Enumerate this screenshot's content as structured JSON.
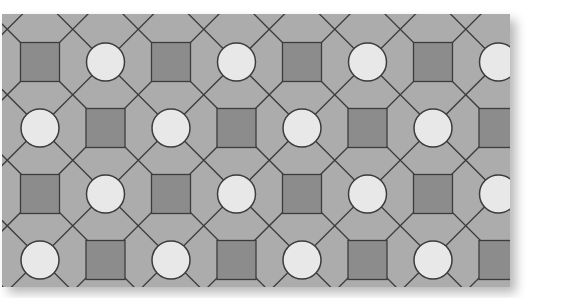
{
  "figure": {
    "x": 2,
    "y": 14,
    "width": 508,
    "height": 273,
    "colors": {
      "background": "#acacac",
      "square_fill": "#8c8c8c",
      "circle_fill": "#e8e8e8",
      "line": "#3c3c3c",
      "shadow": "rgba(0,0,0,0.28)"
    },
    "grid": {
      "origin_x": 38,
      "origin_y": 48,
      "step_x": 65.5,
      "step_y": 66,
      "cols": 8,
      "rows": 4,
      "square_half": 19.5,
      "circle_radius": 19
    },
    "row_pattern": [
      [
        "square",
        "circle",
        "square",
        "circle",
        "square",
        "circle",
        "square",
        "circle"
      ],
      [
        "circle",
        "square",
        "circle",
        "square",
        "circle",
        "square",
        "circle",
        "square"
      ],
      [
        "square",
        "circle",
        "square",
        "circle",
        "square",
        "circle",
        "square",
        "circle"
      ],
      [
        "circle",
        "square",
        "circle",
        "square",
        "circle",
        "square",
        "circle",
        "square"
      ]
    ]
  }
}
